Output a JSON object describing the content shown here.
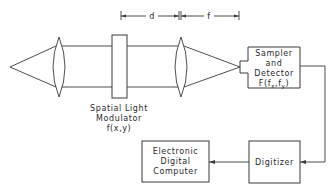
{
  "diagram": {
    "type": "optical-system-block-diagram",
    "dimensions": {
      "d_label": "d",
      "f_label": "f"
    },
    "components": {
      "point_source": {
        "label": ""
      },
      "lens_1": {
        "label": ""
      },
      "slm": {
        "line1": "Spatial Light",
        "line2": "Modulator",
        "line3": "f(x,y)"
      },
      "lens_2": {
        "label": ""
      },
      "sampler": {
        "line1": "Sampler",
        "line2": "and",
        "line3": "Detector",
        "line4": "F(f",
        "sub_x": "x",
        "mid": ",f",
        "sub_y": "y",
        "close": ")"
      },
      "digitizer": {
        "label": "Digitizer"
      },
      "computer": {
        "line1": "Electronic",
        "line2": "Digital",
        "line3": "Computer"
      }
    },
    "connections": [
      {
        "from": "sampler",
        "to": "digitizer"
      },
      {
        "from": "digitizer",
        "to": "computer"
      }
    ],
    "colors": {
      "line": "#3a3a3a",
      "text": "#2a2a2a",
      "background": "#ffffff"
    }
  }
}
